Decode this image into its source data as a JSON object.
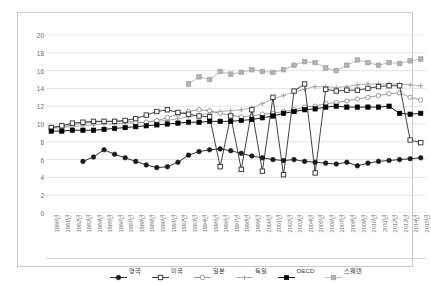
{
  "chart_data": {
    "type": "line",
    "title": "",
    "xlabel": "",
    "ylabel": "",
    "ylim": [
      0,
      20
    ],
    "ytick_step": 2,
    "grid": true,
    "legend_position": "bottom",
    "yticks": [
      "0",
      "2",
      "4",
      "6",
      "8",
      "10",
      "12",
      "14",
      "16",
      "18",
      "20"
    ],
    "categories": [
      "1980년",
      "1981년",
      "1982년",
      "1983년",
      "1984년",
      "1985년",
      "1986년",
      "1987년",
      "1988년",
      "1989년",
      "1990년",
      "1991년",
      "1992년",
      "1993년",
      "1994년",
      "1995년",
      "1996년",
      "1997년",
      "1998년",
      "1999년",
      "2000년",
      "2001년",
      "2002년",
      "2003년",
      "2004년",
      "2005년",
      "2006년",
      "2007년",
      "2008년",
      "2009년",
      "2010년",
      "2011년",
      "2012년",
      "2013년",
      "2014년",
      "2015년"
    ],
    "series": [
      {
        "name": "영국",
        "color": "#1a1a1a",
        "marker": "circle-filled",
        "values": [
          null,
          null,
          null,
          5.8,
          6.3,
          7.1,
          6.6,
          6.2,
          5.8,
          5.4,
          5.1,
          5.2,
          5.7,
          6.5,
          6.9,
          7.1,
          7.2,
          7.0,
          6.7,
          6.4,
          6.2,
          6.0,
          5.9,
          6.0,
          5.8,
          5.7,
          5.6,
          5.5,
          5.7,
          5.3,
          5.6,
          5.8,
          5.9,
          6.0,
          6.1,
          6.2
        ]
      },
      {
        "name": "미국",
        "color": "#2b2b2b",
        "marker": "square-open",
        "values": [
          9.6,
          9.8,
          10.1,
          10.2,
          10.3,
          10.3,
          10.3,
          10.4,
          10.6,
          11.0,
          11.4,
          11.6,
          11.3,
          11.1,
          10.9,
          10.8,
          5.2,
          10.9,
          4.9,
          11.6,
          4.7,
          13.0,
          4.3,
          13.7,
          14.5,
          4.5,
          13.9,
          13.7,
          13.8,
          13.8,
          14.0,
          14.2,
          14.3,
          14.3,
          8.2,
          7.9
        ]
      },
      {
        "name": "일본",
        "color": "#8f8f8f",
        "marker": "circle-open",
        "values": [
          9.6,
          9.7,
          9.9,
          10.1,
          10.2,
          10.3,
          10.3,
          10.3,
          10.2,
          10.2,
          10.4,
          10.7,
          11.1,
          11.4,
          11.6,
          11.5,
          11.2,
          11.0,
          10.8,
          10.9,
          11.1,
          11.2,
          11.4,
          11.6,
          11.9,
          12.0,
          12.3,
          12.4,
          12.6,
          12.8,
          13.0,
          13.2,
          13.4,
          13.5,
          13.0,
          12.7
        ]
      },
      {
        "name": "독일",
        "color": "#a6a6a6",
        "marker": "plus",
        "values": [
          9.5,
          9.6,
          9.7,
          9.8,
          9.9,
          10.0,
          10.0,
          10.1,
          10.1,
          10.2,
          10.3,
          10.4,
          10.6,
          10.8,
          11.0,
          11.2,
          11.4,
          11.5,
          11.6,
          11.8,
          12.3,
          12.8,
          13.2,
          13.6,
          13.9,
          14.2,
          14.2,
          14.1,
          14.2,
          14.4,
          14.5,
          14.5,
          14.5,
          14.5,
          14.4,
          14.3
        ]
      },
      {
        "name": "OECD",
        "color": "#000000",
        "marker": "square-filled",
        "values": [
          9.2,
          9.2,
          9.3,
          9.3,
          9.3,
          9.4,
          9.5,
          9.6,
          9.7,
          9.8,
          9.9,
          10.0,
          10.1,
          10.2,
          10.2,
          10.3,
          10.3,
          10.3,
          10.4,
          10.5,
          10.7,
          10.9,
          11.2,
          11.4,
          11.6,
          11.7,
          11.9,
          12.0,
          11.9,
          11.9,
          11.9,
          11.9,
          12.0,
          11.2,
          11.1,
          11.2
        ]
      },
      {
        "name": "스웨덴",
        "color": "#b3b3b3",
        "marker": "square-gray",
        "values": [
          null,
          null,
          null,
          null,
          null,
          null,
          null,
          null,
          null,
          null,
          null,
          null,
          null,
          14.5,
          15.3,
          15.0,
          15.9,
          15.6,
          15.8,
          16.1,
          15.9,
          15.8,
          16.1,
          16.6,
          17.0,
          16.9,
          16.3,
          16.0,
          16.6,
          17.2,
          16.9,
          16.6,
          16.9,
          16.8,
          17.1,
          17.3
        ]
      }
    ]
  }
}
